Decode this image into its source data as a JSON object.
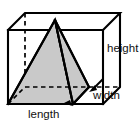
{
  "figure": {
    "kind": "geometry-diagram",
    "background_color": "#ffffff",
    "stroke_color": "#000000",
    "pyramid_fill_color": "#c9c9c9",
    "cube_fill_color": "#ffffff",
    "labels": {
      "height": "height",
      "width": "width",
      "length": "length"
    },
    "geometry": {
      "cube": {
        "front_top_left": [
          8,
          30
        ],
        "front_top_right": [
          103,
          30
        ],
        "front_bottom_left": [
          8,
          104
        ],
        "front_bottom_right": [
          103,
          104
        ],
        "back_top_left": [
          25,
          13
        ],
        "back_top_right": [
          120,
          13
        ],
        "back_bottom_left": [
          25,
          87
        ],
        "back_bottom_right": [
          120,
          87
        ]
      },
      "pyramid": {
        "apex": [
          55,
          20
        ],
        "base_front_left": [
          8,
          104
        ],
        "base_front_right": [
          73,
          104
        ],
        "base_back_right": [
          89,
          87
        ],
        "base_back_left": [
          25,
          87
        ]
      }
    }
  }
}
